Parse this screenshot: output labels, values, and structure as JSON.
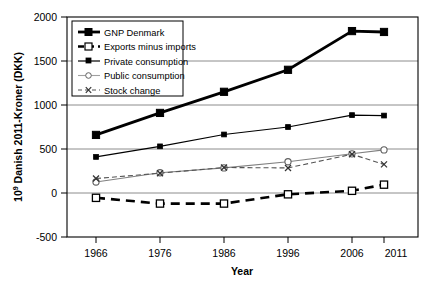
{
  "chart_data": {
    "type": "line",
    "title": "",
    "xlabel": "Year",
    "ylabel_main": " Danish 2011-Kroner (DKK)",
    "ylabel_prefix": "10",
    "ylabel_exponent": "9",
    "categories": [
      "1966",
      "1976",
      "1986",
      "1996",
      "2006",
      "2011"
    ],
    "x": [
      1966,
      1976,
      1986,
      1996,
      2006,
      2011
    ],
    "xlim": [
      1961,
      2016
    ],
    "ylim": [
      -500,
      2000
    ],
    "yticks": [
      -500,
      0,
      500,
      1000,
      1500,
      2000
    ],
    "ytick_labels": [
      "-500",
      "0",
      "500",
      "1000",
      "1500",
      "2000"
    ],
    "grid": "horizontal",
    "legend_position": "upper-left-inside",
    "series": [
      {
        "name": "GNP Denmark",
        "values": [
          660,
          910,
          1150,
          1400,
          1840,
          1830
        ],
        "marker": "filled-square",
        "line": "solid-thick",
        "color": "#000000"
      },
      {
        "name": "Exports minus imports",
        "values": [
          -55,
          -120,
          -120,
          -15,
          25,
          95
        ],
        "marker": "open-square",
        "line": "dashed-thick",
        "color": "#000000"
      },
      {
        "name": "Private consumption",
        "values": [
          410,
          530,
          665,
          750,
          885,
          880
        ],
        "marker": "filled-dot",
        "line": "solid-thin",
        "color": "#000000"
      },
      {
        "name": "Public consumption",
        "values": [
          125,
          230,
          285,
          355,
          445,
          490
        ],
        "marker": "open-circle",
        "line": "solid-thin-gray",
        "color": "#808080"
      },
      {
        "name": "Stock change",
        "values": [
          165,
          225,
          290,
          285,
          440,
          325
        ],
        "marker": "cross-x",
        "line": "dashed-thin",
        "color": "#555555"
      }
    ]
  }
}
